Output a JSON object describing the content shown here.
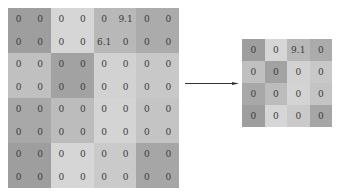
{
  "input_grid": {
    "rows": [
      [
        "0",
        "0",
        "0",
        "0",
        "0",
        "9.1",
        "0",
        "0"
      ],
      [
        "0",
        "0",
        "0",
        "0",
        "6.1",
        "0",
        "0",
        "0"
      ],
      [
        "0",
        "0",
        "0",
        "0",
        "0",
        "0",
        "0",
        "0"
      ],
      [
        "0",
        "0",
        "0",
        "0",
        "0",
        "0",
        "0",
        "0"
      ],
      [
        "0",
        "0",
        "0",
        "0",
        "0",
        "0",
        "0",
        "0"
      ],
      [
        "0",
        "0",
        "0",
        "0",
        "0",
        "0",
        "0",
        "0"
      ],
      [
        "0",
        "0",
        "0",
        "0",
        "0",
        "0",
        "0",
        "0"
      ],
      [
        "0",
        "0",
        "0",
        "0",
        "0",
        "0",
        "0",
        "0"
      ]
    ],
    "block_colors": [
      [
        "#9e9e9e",
        "#d6d6d6",
        "#b8b8b8",
        "#ababab"
      ],
      [
        "#c0c0c0",
        "#a2a2a2",
        "#d2d2d2",
        "#c8c8c8"
      ],
      [
        "#a8a8a8",
        "#bcbcbc",
        "#d4d4d4",
        "#c4c4c4"
      ],
      [
        "#9e9e9e",
        "#d6d6d6",
        "#cacaca",
        "#a6a6a6"
      ]
    ]
  },
  "output_grid": {
    "rows": [
      [
        "0",
        "0",
        "9.1",
        "0"
      ],
      [
        "0",
        "0",
        "0",
        "0"
      ],
      [
        "0",
        "0",
        "0",
        "0"
      ],
      [
        "0",
        "0",
        "0",
        "0"
      ]
    ],
    "colors": [
      [
        "#9e9e9e",
        "#d6d6d6",
        "#b8b8b8",
        "#ababab"
      ],
      [
        "#c0c0c0",
        "#a2a2a2",
        "#d2d2d2",
        "#c8c8c8"
      ],
      [
        "#a8a8a8",
        "#bcbcbc",
        "#d4d4d4",
        "#c4c4c4"
      ],
      [
        "#9e9e9e",
        "#d6d6d6",
        "#cacaca",
        "#a6a6a6"
      ]
    ]
  },
  "arrow": {
    "color": "#333333",
    "direction": "right"
  }
}
